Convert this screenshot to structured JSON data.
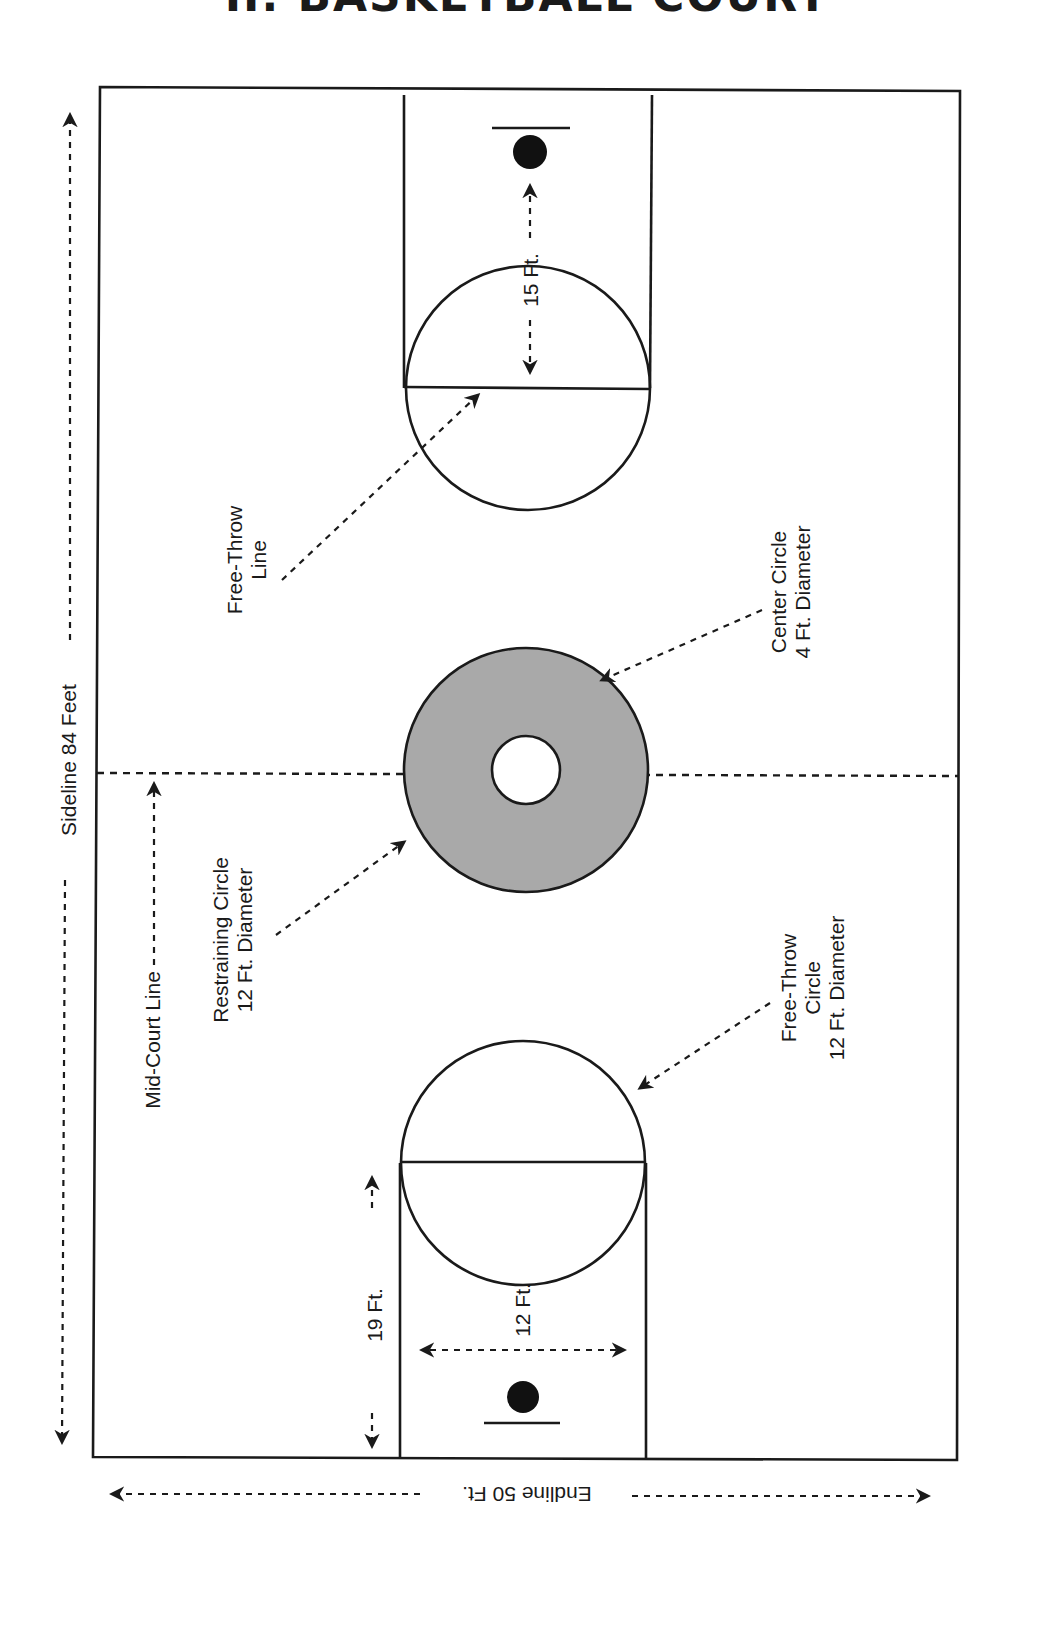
{
  "title": "II. BASKETBALL COURT",
  "colors": {
    "line": "#1a1a1a",
    "restraining_fill": "#a9a9a9",
    "background": "#ffffff"
  },
  "labels": {
    "sideline": "Sideline 84 Feet",
    "endline": "Endline 50 Ft.",
    "mid_court": "Mid-Court Line",
    "free_throw_line": [
      "Free-Throw",
      "Line"
    ],
    "center_circle": [
      "Center Circle",
      "4 Ft. Diameter"
    ],
    "restraining_circle": [
      "Restraining Circle",
      "12 Ft. Diameter"
    ],
    "free_throw_circle": [
      "Free-Throw",
      "Circle",
      "12 Ft. Diameter"
    ],
    "dim_15": "15 Ft.",
    "dim_19": "19 Ft.",
    "dim_12": "12 Ft."
  },
  "dimensions": {
    "sideline_ft": 84,
    "endline_ft": 50,
    "center_circle_diameter_ft": 4,
    "restraining_circle_diameter_ft": 12,
    "free_throw_circle_diameter_ft": 12,
    "basket_to_free_throw_line_ft": 15,
    "endline_to_free_throw_line_ft": 19,
    "lane_width_ft": 12
  }
}
